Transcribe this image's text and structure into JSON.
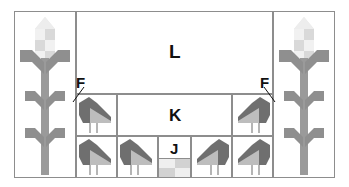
{
  "diagram": {
    "kind": "pieced quilt block schematic",
    "border_color": "#8d8d8d",
    "background_color": "#ffffff"
  },
  "labels": {
    "L": "L",
    "K": "K",
    "J": "J",
    "F_left": "F",
    "F_right": "F"
  },
  "palette": {
    "outline": "#8d8d8d",
    "stalk_gray": "#9a9a9a",
    "leaf_gray": "#8f8f8f",
    "corn_light": "#eaeaea",
    "corn_mid": "#d8d8d8",
    "corn_dark": "#c9c9c9",
    "bird_body_dark": "#6f6f6f",
    "bird_wing_light": "#bdbdbd",
    "bird_leg": "#b5b5b5",
    "checker_light": "#efefef",
    "checker_dark": "#d2d2d2",
    "text": "#111111"
  },
  "panels": {
    "left_corn": {
      "name": "corn stalk motif",
      "orientation": "upright"
    },
    "right_corn": {
      "name": "corn stalk motif",
      "orientation": "upright"
    }
  },
  "regions": [
    {
      "id": "L",
      "label": "L",
      "role": "large top background rectangle"
    },
    {
      "id": "K",
      "label": "K",
      "role": "center middle strip"
    },
    {
      "id": "J",
      "label": "J",
      "role": "center bottom small block with four-patch"
    }
  ],
  "birds": {
    "middle_row": [
      {
        "position": "left",
        "facing": "right"
      },
      {
        "position": "right",
        "facing": "left"
      }
    ],
    "bottom_row": [
      {
        "position": "far-left",
        "facing": "right"
      },
      {
        "position": "inner-left",
        "facing": "right"
      },
      {
        "position": "inner-right",
        "facing": "left"
      },
      {
        "position": "far-right",
        "facing": "left"
      }
    ]
  },
  "four_patch": {
    "cells": [
      "light",
      "dark",
      "dark",
      "light"
    ]
  }
}
